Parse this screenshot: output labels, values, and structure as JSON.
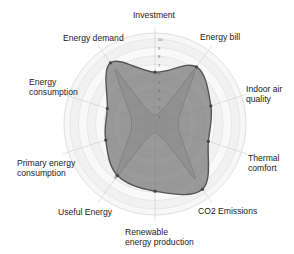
{
  "chart_data": {
    "type": "radar",
    "title": "",
    "axes": [
      "Investment",
      "Energy bill",
      "Indoor air quality",
      "Thermal comfort",
      "CO2 Emissions",
      "Renewable energy production",
      "Useful Energy",
      "Primary energy consumption",
      "Energy consumption",
      "Energy demand"
    ],
    "axis_labels_display": [
      [
        "Investment"
      ],
      [
        "Energy bill"
      ],
      [
        "Indoor air",
        "quality"
      ],
      [
        "Thermal",
        "comfort"
      ],
      [
        "CO2 Emissions"
      ],
      [
        "Renewable",
        "energy production"
      ],
      [
        "Useful Energy"
      ],
      [
        "Primary energy",
        "consumption"
      ],
      [
        "Energy",
        "consumption"
      ],
      [
        "Energy demand"
      ]
    ],
    "rlim": [
      0,
      10
    ],
    "radial_ticks": [
      1,
      2,
      3,
      4,
      5,
      6,
      7,
      8,
      9,
      10
    ],
    "grid": true,
    "legend": null,
    "series": [
      {
        "name": "Series 1",
        "values": [
          6.1,
          8.3,
          6.9,
          6.6,
          9.5,
          7.9,
          7.5,
          6.1,
          5.9,
          8.9
        ],
        "fill": "#7a7a7a",
        "stroke": "#555555",
        "fill_opacity": 0.75
      },
      {
        "name": "Series 2",
        "values": [
          1.0,
          8.0,
          3.0,
          3.0,
          8.0,
          1.0,
          8.0,
          3.0,
          3.0,
          8.0
        ],
        "fill": "#9a9a9a",
        "stroke": "#8a8a8a",
        "fill_opacity": 0.35
      }
    ]
  },
  "labels": {
    "l0": "Investment",
    "l1": "Energy bill",
    "l2a": "Indoor air",
    "l2b": "quality",
    "l3a": "Thermal",
    "l3b": "comfort",
    "l4": "CO2 Emissions",
    "l5a": "Renewable",
    "l5b": "energy production",
    "l6": "Useful Energy",
    "l7a": "Primary energy",
    "l7b": "consumption",
    "l8a": "Energy",
    "l8b": "consumption",
    "l9": "Energy demand"
  }
}
